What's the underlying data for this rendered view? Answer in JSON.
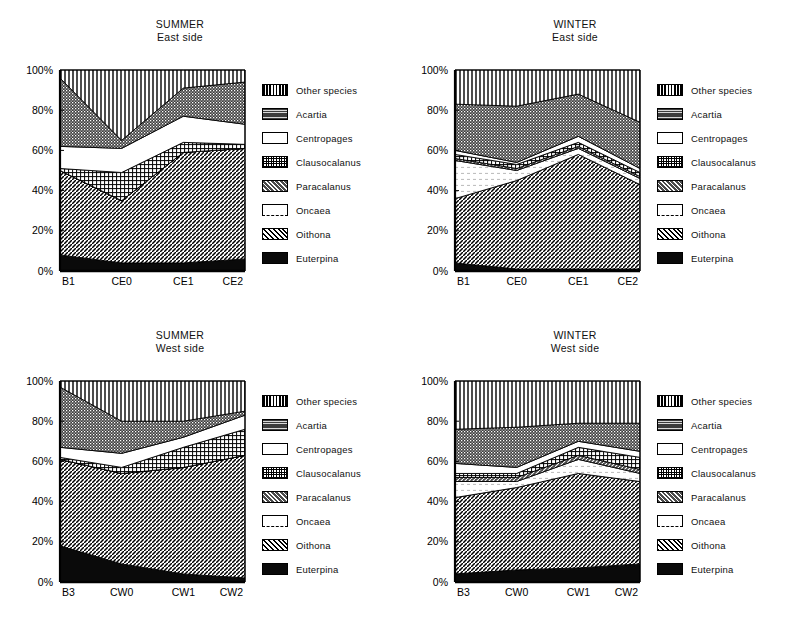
{
  "figure": {
    "panels": [
      {
        "id": "summer-east",
        "season": "SUMMER",
        "side": "East side",
        "position": "top-left"
      },
      {
        "id": "winter-east",
        "season": "WINTER",
        "side": "East side",
        "position": "top-right"
      },
      {
        "id": "summer-west",
        "season": "SUMMER",
        "side": "West side",
        "position": "bottom-left"
      },
      {
        "id": "winter-west",
        "season": "WINTER",
        "side": "West side",
        "position": "bottom-right"
      }
    ],
    "legend_labels": [
      "Other species",
      "Acartia",
      "Centropages",
      "Clausocalanus",
      "Paracalanus",
      "Oncaea",
      "Oithona",
      "Euterpina"
    ],
    "legend_patterns": [
      "vertical-lines",
      "dense-dots-dark",
      "solid-white",
      "fine-grid",
      "diagonal-hatch-dark",
      "white-dashed",
      "diagonal-hatch-light",
      "solid-black"
    ],
    "y_ticks": [
      "0%",
      "20%",
      "40%",
      "60%",
      "80%",
      "100%"
    ],
    "colors": {
      "ink": "#000000",
      "paper": "#ffffff",
      "dark_fill": "#3a3a3a",
      "mid_fill": "#8c8c8c",
      "light_fill": "#d4d4d4"
    }
  },
  "chart_data": [
    {
      "type": "area",
      "id": "summer-east",
      "title": "SUMMER East side",
      "xlabel": "",
      "ylabel": "",
      "ylim": [
        0,
        100
      ],
      "yticks": [
        0,
        20,
        40,
        60,
        80,
        100
      ],
      "ytick_labels": [
        "0%",
        "20%",
        "40%",
        "60%",
        "80%",
        "100%"
      ],
      "grid": false,
      "legend_position": "right",
      "stacked": true,
      "normalized_percent": true,
      "categories": [
        "B1",
        "CE0",
        "CE1",
        "CE2"
      ],
      "series": [
        {
          "name": "Euterpina",
          "values": [
            8,
            4,
            4,
            6
          ]
        },
        {
          "name": "Oithona",
          "values": [
            42,
            31,
            55,
            55
          ]
        },
        {
          "name": "Oncaea",
          "values": [
            0,
            0,
            0,
            0
          ]
        },
        {
          "name": "Paracalanus",
          "values": [
            0,
            0,
            0,
            0
          ]
        },
        {
          "name": "Clausocalanus",
          "values": [
            1,
            14,
            5,
            2
          ]
        },
        {
          "name": "Centropages",
          "values": [
            11,
            12,
            13,
            10
          ]
        },
        {
          "name": "Acartia",
          "values": [
            34,
            4,
            14,
            21
          ]
        },
        {
          "name": "Other species",
          "values": [
            4,
            35,
            9,
            6
          ]
        }
      ],
      "cumulative_boundaries": {
        "B1": {
          "Euterpina": 8,
          "Oithona": 50,
          "Oncaea": 50,
          "Paracalanus": 50,
          "Clausocalanus": 51,
          "Centropages": 62,
          "Acartia": 96,
          "Other species": 100
        },
        "CE0": {
          "Euterpina": 4,
          "Oithona": 35,
          "Oncaea": 35,
          "Paracalanus": 35,
          "Clausocalanus": 49,
          "Centropages": 61,
          "Acartia": 65,
          "Other species": 100
        },
        "CE1": {
          "Euterpina": 4,
          "Oithona": 59,
          "Oncaea": 59,
          "Paracalanus": 59,
          "Clausocalanus": 64,
          "Centropages": 77,
          "Acartia": 91,
          "Other species": 100
        },
        "CE2": {
          "Euterpina": 6,
          "Oithona": 61,
          "Oncaea": 61,
          "Paracalanus": 61,
          "Clausocalanus": 63,
          "Centropages": 73,
          "Acartia": 94,
          "Other species": 100
        }
      }
    },
    {
      "type": "area",
      "id": "winter-east",
      "title": "WINTER East side",
      "xlabel": "",
      "ylabel": "",
      "ylim": [
        0,
        100
      ],
      "yticks": [
        0,
        20,
        40,
        60,
        80,
        100
      ],
      "ytick_labels": [
        "0%",
        "20%",
        "40%",
        "60%",
        "80%",
        "100%"
      ],
      "grid": false,
      "legend_position": "right",
      "stacked": true,
      "normalized_percent": true,
      "categories": [
        "B1",
        "CE0",
        "CE1",
        "CE2"
      ],
      "series": [
        {
          "name": "Euterpina",
          "values": [
            4,
            1,
            1,
            1
          ]
        },
        {
          "name": "Oithona",
          "values": [
            32,
            44,
            57,
            42
          ]
        },
        {
          "name": "Oncaea",
          "values": [
            19,
            5,
            3,
            3
          ]
        },
        {
          "name": "Paracalanus",
          "values": [
            1,
            1,
            1,
            1
          ]
        },
        {
          "name": "Clausocalanus",
          "values": [
            2,
            2,
            2,
            2
          ]
        },
        {
          "name": "Centropages",
          "values": [
            2,
            1,
            3,
            2
          ]
        },
        {
          "name": "Acartia",
          "values": [
            23,
            28,
            21,
            23
          ]
        },
        {
          "name": "Other species",
          "values": [
            17,
            18,
            12,
            26
          ]
        }
      ],
      "cumulative_boundaries": {
        "B1": {
          "Euterpina": 4,
          "Oithona": 36,
          "Oncaea": 55,
          "Paracalanus": 56,
          "Clausocalanus": 58,
          "Centropages": 60,
          "Acartia": 83,
          "Other species": 100
        },
        "CE0": {
          "Euterpina": 1,
          "Oithona": 45,
          "Oncaea": 50,
          "Paracalanus": 51,
          "Clausocalanus": 53,
          "Centropages": 54,
          "Acartia": 82,
          "Other species": 100
        },
        "CE1": {
          "Euterpina": 1,
          "Oithona": 58,
          "Oncaea": 61,
          "Paracalanus": 62,
          "Clausocalanus": 64,
          "Centropages": 67,
          "Acartia": 88,
          "Other species": 100
        },
        "CE2": {
          "Euterpina": 1,
          "Oithona": 43,
          "Oncaea": 46,
          "Paracalanus": 47,
          "Clausocalanus": 49,
          "Centropages": 51,
          "Acartia": 74,
          "Other species": 100
        }
      }
    },
    {
      "type": "area",
      "id": "summer-west",
      "title": "SUMMER West side",
      "xlabel": "",
      "ylabel": "",
      "ylim": [
        0,
        100
      ],
      "yticks": [
        0,
        20,
        40,
        60,
        80,
        100
      ],
      "ytick_labels": [
        "0%",
        "20%",
        "40%",
        "60%",
        "80%",
        "100%"
      ],
      "grid": false,
      "legend_position": "right",
      "stacked": true,
      "normalized_percent": true,
      "categories": [
        "B3",
        "CW0",
        "CW1",
        "CW2"
      ],
      "series": [
        {
          "name": "Euterpina",
          "values": [
            18,
            9,
            4,
            2
          ]
        },
        {
          "name": "Oithona",
          "values": [
            43,
            45,
            53,
            61
          ]
        },
        {
          "name": "Oncaea",
          "values": [
            0,
            0,
            0,
            0
          ]
        },
        {
          "name": "Paracalanus",
          "values": [
            0,
            0,
            0,
            0
          ]
        },
        {
          "name": "Clausocalanus",
          "values": [
            1,
            3,
            10,
            13
          ]
        },
        {
          "name": "Centropages",
          "values": [
            5,
            7,
            5,
            7
          ]
        },
        {
          "name": "Acartia",
          "values": [
            30,
            16,
            8,
            2
          ]
        },
        {
          "name": "Other species",
          "values": [
            3,
            20,
            20,
            15
          ]
        }
      ],
      "cumulative_boundaries": {
        "B3": {
          "Euterpina": 18,
          "Oithona": 61,
          "Oncaea": 61,
          "Paracalanus": 61,
          "Clausocalanus": 62,
          "Centropages": 67,
          "Acartia": 97,
          "Other species": 100
        },
        "CW0": {
          "Euterpina": 9,
          "Oithona": 54,
          "Oncaea": 54,
          "Paracalanus": 54,
          "Clausocalanus": 57,
          "Centropages": 64,
          "Acartia": 80,
          "Other species": 100
        },
        "CW1": {
          "Euterpina": 4,
          "Oithona": 57,
          "Oncaea": 57,
          "Paracalanus": 57,
          "Clausocalanus": 67,
          "Centropages": 72,
          "Acartia": 80,
          "Other species": 100
        },
        "CW2": {
          "Euterpina": 2,
          "Oithona": 63,
          "Oncaea": 63,
          "Paracalanus": 63,
          "Clausocalanus": 76,
          "Centropages": 83,
          "Acartia": 85,
          "Other species": 100
        }
      }
    },
    {
      "type": "area",
      "id": "winter-west",
      "title": "WINTER West side",
      "xlabel": "",
      "ylabel": "",
      "ylim": [
        0,
        100
      ],
      "yticks": [
        0,
        20,
        40,
        60,
        80,
        100
      ],
      "ytick_labels": [
        "0%",
        "20%",
        "40%",
        "60%",
        "80%",
        "100%"
      ],
      "grid": false,
      "legend_position": "right",
      "stacked": true,
      "normalized_percent": true,
      "categories": [
        "B3",
        "CW0",
        "CW1",
        "CW2"
      ],
      "series": [
        {
          "name": "Euterpina",
          "values": [
            4,
            6,
            7,
            9
          ]
        },
        {
          "name": "Oithona",
          "values": [
            38,
            41,
            47,
            41
          ]
        },
        {
          "name": "Oncaea",
          "values": [
            8,
            3,
            7,
            4
          ]
        },
        {
          "name": "Paracalanus",
          "values": [
            2,
            2,
            2,
            2
          ]
        },
        {
          "name": "Clausocalanus",
          "values": [
            2,
            2,
            4,
            6
          ]
        },
        {
          "name": "Centropages",
          "values": [
            5,
            3,
            3,
            3
          ]
        },
        {
          "name": "Acartia",
          "values": [
            17,
            20,
            9,
            14
          ]
        },
        {
          "name": "Other species",
          "values": [
            24,
            23,
            21,
            21
          ]
        }
      ],
      "cumulative_boundaries": {
        "B3": {
          "Euterpina": 4,
          "Oithona": 42,
          "Oncaea": 50,
          "Paracalanus": 52,
          "Clausocalanus": 54,
          "Centropages": 59,
          "Acartia": 76,
          "Other species": 100
        },
        "CW0": {
          "Euterpina": 6,
          "Oithona": 47,
          "Oncaea": 50,
          "Paracalanus": 52,
          "Clausocalanus": 54,
          "Centropages": 57,
          "Acartia": 77,
          "Other species": 100
        },
        "CW1": {
          "Euterpina": 7,
          "Oithona": 54,
          "Oncaea": 61,
          "Paracalanus": 63,
          "Clausocalanus": 67,
          "Centropages": 70,
          "Acartia": 79,
          "Other species": 100
        },
        "CW2": {
          "Euterpina": 9,
          "Oithona": 50,
          "Oncaea": 54,
          "Paracalanus": 56,
          "Clausocalanus": 62,
          "Centropages": 65,
          "Acartia": 79,
          "Other species": 100
        }
      }
    }
  ]
}
